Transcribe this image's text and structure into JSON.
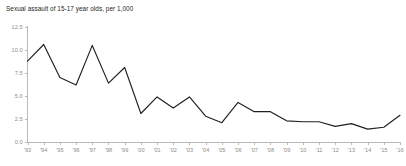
{
  "chart_data": {
    "type": "line",
    "title": "Sexual assault of 15-17 year olds, per 1,000",
    "xlabel": "",
    "ylabel": "",
    "grid": false,
    "legend": false,
    "categories": [
      "'93",
      "'94",
      "'95",
      "'96",
      "'97",
      "'98",
      "'99",
      "'00",
      "'01",
      "'02",
      "'03",
      "'04",
      "'05",
      "'06",
      "'07",
      "'08",
      "'09",
      "'10",
      "'11",
      "'12",
      "'13",
      "'14",
      "'15",
      "'16"
    ],
    "x_tick_labels": [
      "'93",
      "'94",
      "'95",
      "'96",
      "'97",
      "'98",
      "'99",
      "'00",
      "'01",
      "'02",
      "'03",
      "'04",
      "'05",
      "'06",
      "'07",
      "'08",
      "'09",
      "'10",
      "'11",
      "'12",
      "'13",
      "'14",
      "'15",
      "'16"
    ],
    "y_tick_labels": [
      "12.5",
      "10.0",
      "7.5",
      "5.0",
      "2.5",
      "0.0"
    ],
    "y_ticks": [
      12.5,
      10.0,
      7.5,
      5.0,
      2.5,
      0.0
    ],
    "ylim": [
      0.0,
      12.5
    ],
    "values": [
      8.8,
      10.6,
      7.0,
      6.2,
      10.5,
      6.4,
      8.1,
      3.1,
      4.9,
      3.7,
      4.9,
      2.8,
      2.1,
      4.3,
      3.3,
      3.3,
      2.3,
      2.2,
      2.2,
      1.7,
      2.0,
      1.4,
      1.6,
      2.9
    ],
    "series_name": "Sexual assault of 15-17 year olds, per 1,000",
    "line_color": "#231f20",
    "axis_color": "#b9b9b9",
    "tick_label_color": "#8c8c8c",
    "background_color": "#ffffff"
  }
}
